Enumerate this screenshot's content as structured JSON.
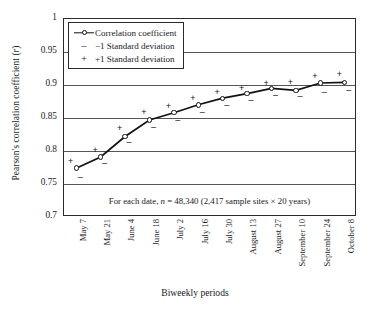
{
  "chart_data": {
    "type": "line",
    "title": "",
    "xlabel": "Biweekly periods",
    "ylabel": "Pearson's correlation coefficient (r)",
    "ylim": [
      0.7,
      1
    ],
    "yticks": [
      "0.7",
      "0.75",
      "0.8",
      "0.85",
      "0.9",
      "0.95",
      "1"
    ],
    "ytick_values": [
      0.7,
      0.75,
      0.8,
      0.85,
      0.9,
      0.95,
      1
    ],
    "grid": true,
    "legend_position": "top-left",
    "annotation": "For each date, n = 48,340 (2,417 sample sites × 20 years)",
    "annotation_prefix": "For each date, ",
    "annotation_italic": "n",
    "annotation_suffix": " = 48,340 (2,417 sample sites × 20 years)",
    "categories": [
      "May 7",
      "May 21",
      "June 4",
      "June 18",
      "July 2",
      "July 16",
      "July 30",
      "August 13",
      "August 27",
      "September 10",
      "September 24",
      "October 8"
    ],
    "series": [
      {
        "name": "Correlation coefficient",
        "marker": "open-circle",
        "values": [
          0.774,
          0.791,
          0.822,
          0.847,
          0.858,
          0.87,
          0.88,
          0.887,
          0.895,
          0.892,
          0.903,
          0.904
        ]
      },
      {
        "name": "-1 Standard deviation",
        "marker": "minus",
        "values": [
          0.761,
          0.782,
          0.813,
          0.836,
          0.847,
          0.859,
          0.87,
          0.877,
          0.885,
          0.883,
          0.89,
          0.892
        ]
      },
      {
        "name": "+1 Standard deviation",
        "marker": "plus",
        "values": [
          0.785,
          0.802,
          0.835,
          0.859,
          0.868,
          0.881,
          0.889,
          0.895,
          0.903,
          0.904,
          0.913,
          0.916
        ]
      }
    ]
  },
  "legend": {
    "items": [
      {
        "label": "Correlation coefficient",
        "key": "line-marker"
      },
      {
        "label": "−1 Standard deviation",
        "key": "minus-glyph",
        "glyph": "–"
      },
      {
        "label": "+1 Standard deviation",
        "key": "plus-glyph",
        "glyph": "+"
      }
    ]
  },
  "colors": {
    "line": "#111111",
    "grid": "#555555",
    "frame": "#2b2b2b",
    "background": "#ffffff"
  }
}
